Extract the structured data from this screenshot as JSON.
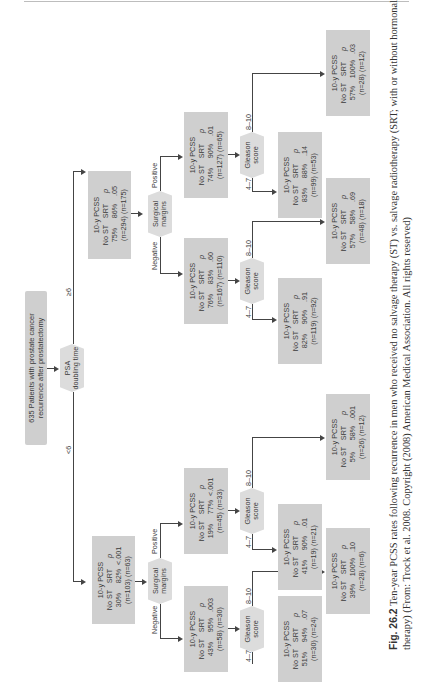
{
  "root": {
    "line1": "635 Patients with prostate cancer",
    "line2": "recurrence after prostatectomy"
  },
  "split_psa": {
    "line1": "PSA",
    "line2": "doubling time",
    "branch_low": "<6",
    "branch_high": "≥6"
  },
  "split_labels": {
    "surgical_1": "Surgical",
    "surgical_2": "margins",
    "gleason_1": "Gleason",
    "gleason_2": "score",
    "negative": "Negative",
    "positive": "Positive",
    "g_low": "4–7",
    "g_high": "8–10"
  },
  "node_headers": {
    "title": "10-y PCSS",
    "col_nost": "No ST",
    "col_srt": "SRT",
    "col_p": "p"
  },
  "nodes": {
    "psa_lt6": {
      "nost": "30%",
      "srt": "82%",
      "p": "<.001",
      "n_nost": "(n=103)",
      "n_srt": "(n=63)"
    },
    "psa_ge6": {
      "nost": "75%",
      "srt": "86%",
      "p": ".05",
      "n_nost": "(n=294)",
      "n_srt": "(n=175)"
    },
    "lt6_neg": {
      "nost": "43%",
      "srt": "95%",
      "p": ".003",
      "n_nost": "(n=58)",
      "n_srt": "(n=30)"
    },
    "lt6_pos": {
      "nost": "19%",
      "srt": "77%",
      "p": "<.001",
      "n_nost": "(n=45)",
      "n_srt": "(n=33)"
    },
    "ge6_neg": {
      "nost": "76%",
      "srt": "83%",
      "p": ".60",
      "n_nost": "(n=167)",
      "n_srt": "(n=110)"
    },
    "ge6_pos": {
      "nost": "74%",
      "srt": "90%",
      "p": ".01",
      "n_nost": "(n=127)",
      "n_srt": "(n=65)"
    },
    "lt6_neg_g47": {
      "nost": "51%",
      "srt": "94%",
      "p": ".07",
      "n_nost": "(n=30)",
      "n_srt": "(n=24)"
    },
    "lt6_neg_g810": {
      "nost": "39%",
      "srt": "100%",
      "p": ".10",
      "n_nost": "(n=28)",
      "n_srt": "(n=6)"
    },
    "lt6_pos_g47": {
      "nost": "41%",
      "srt": "90%",
      "p": ".01",
      "n_nost": "(n=19)",
      "n_srt": "(n=21)"
    },
    "lt6_pos_g810": {
      "nost": "5%",
      "srt": "58%",
      "p": ".001",
      "n_nost": "(n=26)",
      "n_srt": "(n=12)"
    },
    "ge6_neg_g47": {
      "nost": "82%",
      "srt": "90%",
      "p": ".91",
      "n_nost": "(n=119)",
      "n_srt": "(n=92)"
    },
    "ge6_neg_g810": {
      "nost": "57%",
      "srt": "58%",
      "p": ".69",
      "n_nost": "(n=48)",
      "n_srt": "(n=18)"
    },
    "ge6_pos_g47": {
      "nost": "83%",
      "srt": "88%",
      "p": ".14",
      "n_nost": "(n=99)",
      "n_srt": "(n=53)"
    },
    "ge6_pos_g810": {
      "nost": "57%",
      "srt": "100%",
      "p": ".03",
      "n_nost": "(n=28)",
      "n_srt": "(n=12)"
    }
  },
  "caption": {
    "label": "Fig. 26.2",
    "text": " Ten-year PCSS rates following recurrence in men who received no salvage therapy (ST) vs. salvage radiotherapy (SRT; with or without hormonal therapy) (From: Trock et al. 2008. Copyright (2008) American Medical Association. All rights reserved)"
  }
}
